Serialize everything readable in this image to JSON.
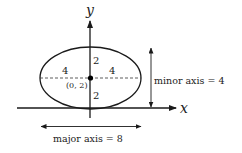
{
  "axes": {
    "x_label": "x",
    "y_label": "y"
  },
  "ellipse": {
    "center_label": "(0, 2)",
    "left_semi_major": "4",
    "right_semi_major": "4",
    "upper_semi_minor": "2",
    "lower_semi_minor": "2"
  },
  "annotations": {
    "minor_axis": "minor axis = 4",
    "major_axis": "major axis = 8"
  },
  "colors": {
    "stroke": "#1a1a1a",
    "text": "#222222"
  }
}
